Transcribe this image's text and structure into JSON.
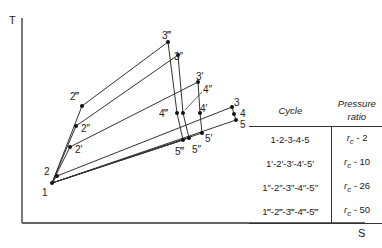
{
  "axes": {
    "y_label": "T",
    "x_label": "S"
  },
  "points": [
    {
      "id": "1",
      "label": "1",
      "x": 52,
      "y": 183,
      "lx": 42,
      "ly": 196
    },
    {
      "id": "2",
      "label": "2",
      "x": 57,
      "y": 176,
      "lx": 44,
      "ly": 175
    },
    {
      "id": "2p",
      "label": "2′",
      "x": 70,
      "y": 147,
      "lx": 75,
      "ly": 153
    },
    {
      "id": "2pp",
      "label": "2″",
      "x": 76,
      "y": 126,
      "lx": 81,
      "ly": 132
    },
    {
      "id": "2ppp",
      "label": "2‴",
      "x": 82,
      "y": 106,
      "lx": 70,
      "ly": 100
    },
    {
      "id": "3ppp",
      "label": "3‴",
      "x": 168,
      "y": 42,
      "lx": 162,
      "ly": 39
    },
    {
      "id": "3pp",
      "label": "3″",
      "x": 178,
      "y": 55,
      "lx": 174,
      "ly": 60
    },
    {
      "id": "3p",
      "label": "3′",
      "x": 198,
      "y": 82,
      "lx": 196,
      "ly": 80
    },
    {
      "id": "3",
      "label": "3",
      "x": 232,
      "y": 107,
      "lx": 234,
      "ly": 106
    },
    {
      "id": "4ppp",
      "label": "4‴",
      "x": 177,
      "y": 113,
      "lx": 159,
      "ly": 117
    },
    {
      "id": "4pp",
      "label": "4″",
      "x": 183,
      "y": 113,
      "lx": 203,
      "ly": 93
    },
    {
      "id": "4p",
      "label": "4′",
      "x": 200,
      "y": 113,
      "lx": 200,
      "ly": 112
    },
    {
      "id": "4",
      "label": "4",
      "x": 234,
      "y": 114,
      "lx": 240,
      "ly": 117
    },
    {
      "id": "5ppp",
      "label": "5‴",
      "x": 183,
      "y": 140,
      "lx": 175,
      "ly": 155
    },
    {
      "id": "5pp",
      "label": "5″",
      "x": 189,
      "y": 138,
      "lx": 192,
      "ly": 153
    },
    {
      "id": "5p",
      "label": "5′",
      "x": 202,
      "y": 133,
      "lx": 205,
      "ly": 142
    },
    {
      "id": "5",
      "label": "5",
      "x": 236,
      "y": 120,
      "lx": 240,
      "ly": 128
    }
  ],
  "cycles": [
    {
      "name": "1-2-3-4-5",
      "path": [
        "1",
        "2",
        "3",
        "4",
        "5",
        "1"
      ]
    },
    {
      "name": "1′-2′-3′-4′-5′",
      "path": [
        "1",
        "2p",
        "3p",
        "4p",
        "5p",
        "1"
      ]
    },
    {
      "name": "1″-2″-3″-4″-5″",
      "path": [
        "1",
        "2pp",
        "3pp",
        "4pp",
        "5pp",
        "1"
      ]
    },
    {
      "name": "1‴-2‴-3‴-4‴-5‴",
      "path": [
        "1",
        "2ppp",
        "3ppp",
        "4ppp",
        "5ppp",
        "1"
      ]
    }
  ],
  "legend": {
    "headers": {
      "cycle": "Cycle",
      "ratio_line1": "Pressure",
      "ratio_line2": "ratio"
    },
    "rows": [
      {
        "cycle": "1-2-3-4-5",
        "rc": "r",
        "rc_sub": "c",
        "ratio": " - 2"
      },
      {
        "cycle": "1′-2′-3′-4′-5′",
        "rc": "r",
        "rc_sub": "c",
        "ratio": " - 10"
      },
      {
        "cycle": "1″-2″-3″-4″-5″",
        "rc": "r",
        "rc_sub": "c",
        "ratio": " - 26"
      },
      {
        "cycle": "1‴-2‴-3‴-4‴-5‴",
        "rc": "r",
        "rc_sub": "c",
        "ratio": " - 50"
      }
    ]
  },
  "colors": {
    "line": "#333333",
    "text": "#222222",
    "background": "#ffffff"
  }
}
